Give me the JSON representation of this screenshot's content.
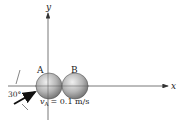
{
  "diagram": {
    "axes": {
      "x_label": "x",
      "y_label": "y"
    },
    "balls": [
      {
        "label": "A",
        "cx": 48,
        "cy": 86,
        "r": 13
      },
      {
        "label": "B",
        "cx": 75,
        "cy": 86,
        "r": 13
      }
    ],
    "angle_label": "30°",
    "velocity": {
      "symbol": "v",
      "subscript": "A",
      "value_text": "= 0.1 m/s"
    },
    "colors": {
      "axis": "#444444",
      "ball_light": "#e6e6e6",
      "ball_dark": "#7a7a7a",
      "arrow": "#111111"
    }
  }
}
